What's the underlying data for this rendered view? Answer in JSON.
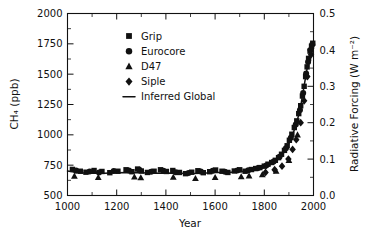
{
  "chart_data": {
    "type": "scatter",
    "title": "",
    "xlabel": "Year",
    "ylabel": "CH₄ (ppb)",
    "ylabel_right": "Radiative Forcing (W m⁻²)",
    "xlim": [
      1000,
      2000
    ],
    "ylim": [
      500,
      2000
    ],
    "ylim_right": [
      0.0,
      0.5
    ],
    "xticks": [
      1000,
      1200,
      1400,
      1600,
      1800,
      2000
    ],
    "xticklabels": [
      "1000",
      "1200",
      "1400",
      "1600",
      "1800",
      "2000"
    ],
    "yticks": [
      500,
      750,
      1000,
      1250,
      1500,
      1750,
      2000
    ],
    "yticklabels": [
      "500",
      "750",
      "1000",
      "1250",
      "1500",
      "1750",
      "2000"
    ],
    "yticks_right": [
      0.0,
      0.1,
      0.2,
      0.3,
      0.4,
      0.5
    ],
    "yticklabels_right": [
      "0.0",
      "0.1",
      "0.2",
      "0.3",
      "0.4",
      "0.5"
    ],
    "x_minor_interval": 100,
    "y_minor_interval": 125,
    "grid": false,
    "legend_position": "upper center",
    "legend": [
      {
        "name": "Grip",
        "marker": "square"
      },
      {
        "name": "Eurocore",
        "marker": "circle"
      },
      {
        "name": "D47",
        "marker": "triangle"
      },
      {
        "name": "Siple",
        "marker": "diamond"
      },
      {
        "name": "Inferred Global",
        "marker": "line"
      }
    ],
    "series": [
      {
        "name": "Grip",
        "marker": "square",
        "points": [
          [
            1020,
            715
          ],
          [
            1052,
            700
          ],
          [
            1075,
            692
          ],
          [
            1108,
            706
          ],
          [
            1140,
            698
          ],
          [
            1172,
            688
          ],
          [
            1205,
            700
          ],
          [
            1238,
            712
          ],
          [
            1262,
            696
          ],
          [
            1285,
            718
          ],
          [
            1300,
            702
          ],
          [
            1325,
            690
          ],
          [
            1352,
            700
          ],
          [
            1378,
            712
          ],
          [
            1402,
            698
          ],
          [
            1428,
            706
          ],
          [
            1455,
            690
          ],
          [
            1480,
            680
          ],
          [
            1505,
            692
          ],
          [
            1530,
            704
          ],
          [
            1552,
            688
          ],
          [
            1578,
            696
          ],
          [
            1602,
            710
          ],
          [
            1628,
            700
          ],
          [
            1652,
            690
          ],
          [
            1678,
            702
          ],
          [
            1700,
            712
          ],
          [
            1722,
            700
          ],
          [
            1748,
            714
          ],
          [
            1765,
            722
          ],
          [
            1782,
            730
          ],
          [
            1800,
            742
          ],
          [
            1815,
            758
          ],
          [
            1830,
            772
          ],
          [
            1845,
            790
          ],
          [
            1858,
            812
          ],
          [
            1870,
            840
          ],
          [
            1882,
            872
          ],
          [
            1893,
            910
          ],
          [
            1902,
            955
          ],
          [
            1912,
            1005
          ],
          [
            1922,
            1060
          ],
          [
            1932,
            1115
          ],
          [
            1940,
            1175
          ],
          [
            1948,
            1240
          ],
          [
            1955,
            1320
          ],
          [
            1962,
            1400
          ],
          [
            1968,
            1480
          ],
          [
            1974,
            1560
          ],
          [
            1980,
            1630
          ],
          [
            1986,
            1690
          ],
          [
            1992,
            1730
          ],
          [
            1997,
            1755
          ]
        ]
      },
      {
        "name": "Eurocore",
        "marker": "circle",
        "points": [
          [
            1035,
            705
          ],
          [
            1090,
            698
          ],
          [
            1128,
            690
          ],
          [
            1188,
            702
          ],
          [
            1250,
            706
          ],
          [
            1292,
            712
          ],
          [
            1340,
            696
          ],
          [
            1390,
            704
          ],
          [
            1440,
            692
          ],
          [
            1492,
            686
          ],
          [
            1542,
            698
          ],
          [
            1590,
            704
          ],
          [
            1640,
            696
          ],
          [
            1690,
            706
          ],
          [
            1735,
            708
          ],
          [
            1775,
            726
          ],
          [
            1808,
            748
          ],
          [
            1838,
            780
          ],
          [
            1862,
            820
          ],
          [
            1888,
            890
          ],
          [
            1908,
            975
          ],
          [
            1928,
            1085
          ],
          [
            1945,
            1205
          ],
          [
            1958,
            1345
          ],
          [
            1970,
            1505
          ],
          [
            1978,
            1600
          ],
          [
            1988,
            1700
          ],
          [
            1995,
            1745
          ]
        ]
      },
      {
        "name": "D47",
        "marker": "triangle",
        "points": [
          [
            1028,
            660
          ],
          [
            1125,
            648
          ],
          [
            1272,
            652
          ],
          [
            1298,
            646
          ],
          [
            1430,
            650
          ],
          [
            1520,
            640
          ],
          [
            1600,
            648
          ],
          [
            1706,
            655
          ],
          [
            1738,
            662
          ],
          [
            1792,
            672
          ],
          [
            1848,
            700
          ],
          [
            1900,
            790
          ],
          [
            1935,
            1000
          ]
        ]
      },
      {
        "name": "Siple",
        "marker": "diamond",
        "points": [
          [
            1805,
            690
          ],
          [
            1842,
            712
          ],
          [
            1872,
            742
          ],
          [
            1898,
            800
          ],
          [
            1915,
            880
          ],
          [
            1930,
            960
          ],
          [
            1948,
            1100
          ],
          [
            1962,
            1280
          ],
          [
            1975,
            1480
          ],
          [
            1990,
            1660
          ]
        ]
      },
      {
        "name": "Inferred Global",
        "marker": "line",
        "points": [
          [
            1000,
            702
          ],
          [
            1050,
            688
          ],
          [
            1100,
            684
          ],
          [
            1150,
            684
          ],
          [
            1200,
            688
          ],
          [
            1250,
            690
          ],
          [
            1300,
            688
          ],
          [
            1350,
            684
          ],
          [
            1400,
            686
          ],
          [
            1450,
            684
          ],
          [
            1500,
            682
          ],
          [
            1550,
            684
          ],
          [
            1600,
            690
          ],
          [
            1650,
            690
          ],
          [
            1700,
            696
          ],
          [
            1750,
            706
          ],
          [
            1775,
            716
          ],
          [
            1800,
            730
          ],
          [
            1820,
            748
          ],
          [
            1840,
            772
          ],
          [
            1860,
            806
          ],
          [
            1880,
            856
          ],
          [
            1900,
            930
          ],
          [
            1915,
            1000
          ],
          [
            1930,
            1090
          ],
          [
            1940,
            1165
          ],
          [
            1950,
            1260
          ],
          [
            1960,
            1380
          ],
          [
            1970,
            1500
          ],
          [
            1980,
            1615
          ],
          [
            1990,
            1705
          ],
          [
            2000,
            1760
          ]
        ]
      }
    ]
  }
}
